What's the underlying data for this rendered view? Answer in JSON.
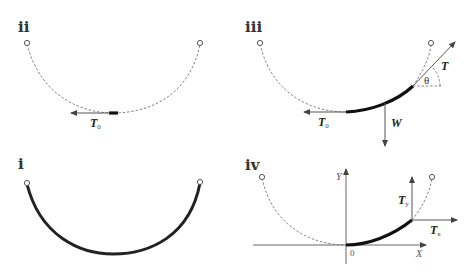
{
  "panels": {
    "ii": {
      "label": "ii",
      "forces": {
        "T0": {
          "main": "T",
          "sub": "0"
        }
      }
    },
    "iii": {
      "label": "iii",
      "forces": {
        "T": {
          "main": "T"
        },
        "T0": {
          "main": "T",
          "sub": "0"
        },
        "W": {
          "main": "W"
        }
      },
      "angle": "θ"
    },
    "i": {
      "label": "i"
    },
    "iv": {
      "label": "iv",
      "axes": {
        "x": "X",
        "y": "Y",
        "origin": "0"
      },
      "forces": {
        "Ty": {
          "main": "T",
          "sub": "y"
        },
        "Tx": {
          "main": "T",
          "sub": "x"
        }
      }
    }
  }
}
